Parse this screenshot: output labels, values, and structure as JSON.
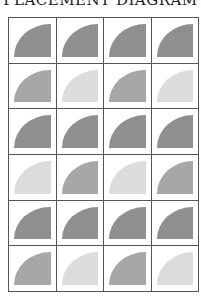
{
  "title": "PLACEMENT DIAGRAM",
  "colors": {
    "dark": "#8f8f8f",
    "medium": "#a7a7a7",
    "light": "#dcdcdc"
  },
  "grid": {
    "columns": 4,
    "rows": [
      [
        "dark",
        "dark",
        "dark",
        "dark"
      ],
      [
        "medium",
        "light",
        "medium",
        "light"
      ],
      [
        "dark",
        "dark",
        "dark",
        "dark"
      ],
      [
        "light",
        "medium",
        "light",
        "medium"
      ],
      [
        "dark",
        "dark",
        "dark",
        "dark"
      ],
      [
        "medium",
        "light",
        "medium",
        "light"
      ]
    ]
  }
}
